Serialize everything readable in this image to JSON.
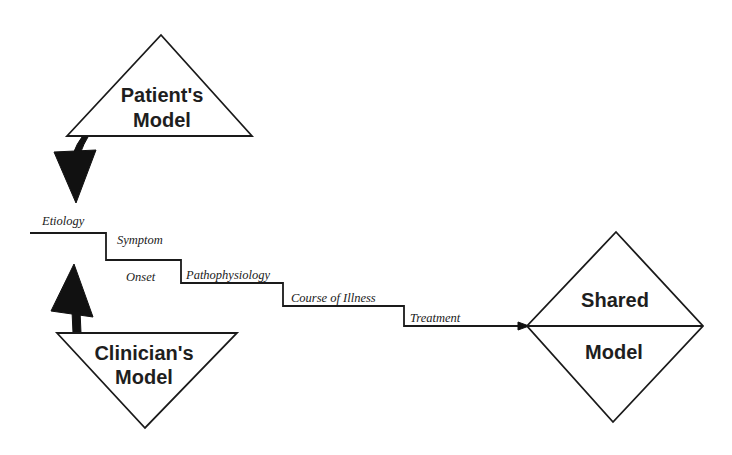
{
  "diagram": {
    "patient_model": {
      "line1": "Patient's",
      "line2": "Model"
    },
    "clinician_model": {
      "line1": "Clinician's",
      "line2": "Model"
    },
    "shared_model": {
      "line1": "Shared",
      "line2": "Model"
    },
    "steps": [
      {
        "label": "Etiology"
      },
      {
        "label": "Symptom"
      },
      {
        "label": "Onset"
      },
      {
        "label": "Pathophysiology"
      },
      {
        "label": "Course of Illness"
      },
      {
        "label": "Treatment"
      }
    ],
    "colors": {
      "stroke": "#1a1a1a",
      "arrow_fill": "#111111",
      "background": "#ffffff"
    }
  }
}
